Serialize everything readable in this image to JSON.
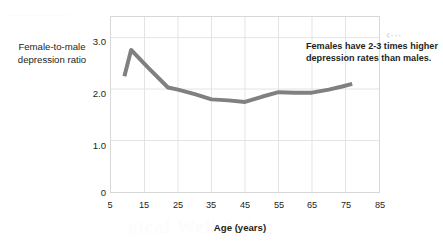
{
  "figure": {
    "background_color": "#ffffff",
    "plot_border_color": "#d8d8d8",
    "grid_color": "#e4e4e4",
    "line_color": "#808080",
    "text_color": "#231f20",
    "leader_mark": "‹···",
    "ghost_text": {
      "top_left": "————",
      "bottom": "gical Well-being",
      "right": "al Well-be"
    }
  },
  "chart_data": {
    "type": "line",
    "title": "",
    "subtitle": "",
    "xlabel": "Age (years)",
    "ylabel": "Female-to-male depression ratio",
    "xlim": [
      5,
      85
    ],
    "ylim": [
      0,
      3.4
    ],
    "xticks": [
      5,
      15,
      25,
      35,
      45,
      55,
      65,
      75,
      85
    ],
    "xtick_labels": [
      "5",
      "15",
      "25",
      "35",
      "45",
      "55",
      "65",
      "75",
      "85"
    ],
    "yticks": [
      0,
      1.0,
      2.0,
      3.0
    ],
    "ytick_labels": [
      "0",
      "1.0",
      "2.0",
      "3.0"
    ],
    "grid": {
      "vertical": [
        15,
        25,
        35,
        45,
        55,
        65,
        75
      ],
      "horizontal": [
        1.0,
        2.0,
        3.0
      ],
      "visible": true
    },
    "legend": {
      "visible": false,
      "position": "none"
    },
    "annotations": [
      {
        "text": "Females have 2-3 times higher depression rates than males.",
        "x": 37,
        "y": 3.1
      }
    ],
    "series": [
      {
        "name": "Female-to-male depression ratio",
        "color": "#808080",
        "line_width": 4,
        "x": [
          9,
          11,
          16,
          22,
          25,
          30,
          35,
          40,
          45,
          50,
          55,
          60,
          65,
          70,
          74,
          77
        ],
        "values": [
          2.25,
          2.76,
          2.42,
          2.03,
          1.99,
          1.9,
          1.8,
          1.78,
          1.75,
          1.85,
          1.94,
          1.93,
          1.93,
          1.99,
          2.05,
          2.1
        ]
      }
    ]
  },
  "y_axis_title_lines": [
    "Female-to-male",
    "depression ratio"
  ],
  "x_axis_title": "Age (years)",
  "annotation_text": "Females have 2-3 times higher depression rates than males."
}
